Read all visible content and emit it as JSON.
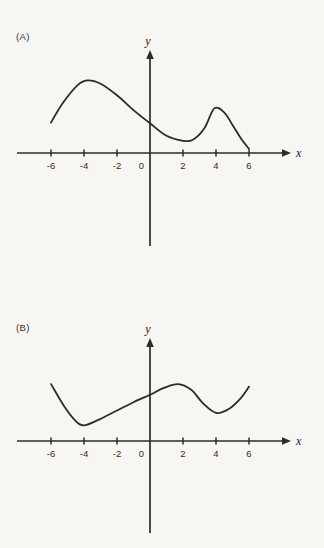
{
  "page": {
    "background": "#f7f6f3",
    "ink": "#2b2b2b"
  },
  "figures": [
    {
      "label": "(A)"
    },
    {
      "label": "(B)"
    }
  ],
  "chart_data": [
    {
      "type": "line",
      "panel": "(A)",
      "title": "",
      "xlabel": "x",
      "ylabel": "y",
      "x_ticks": [
        -6,
        -4,
        -2,
        0,
        2,
        4,
        6
      ],
      "tick_labels": [
        "-6",
        "-4",
        "-2",
        "0",
        "2",
        "4",
        "6"
      ],
      "xlim": [
        -8,
        8.5
      ],
      "ylim": [
        -5.6,
        6.2
      ],
      "grid": false,
      "legend": "none",
      "axes_style": "centered-arrow-axes",
      "x": [
        -6,
        -5.3,
        -4.4,
        -3.8,
        -3,
        -2,
        -1,
        0,
        1,
        2,
        2.6,
        3.3,
        3.9,
        4.5,
        5,
        5.5,
        6
      ],
      "y": [
        1.85,
        3.0,
        4.1,
        4.4,
        4.2,
        3.5,
        2.6,
        1.8,
        1.05,
        0.74,
        0.8,
        1.5,
        2.7,
        2.45,
        1.7,
        0.9,
        0.25
      ],
      "features": {
        "local_max": [
          [
            -3.8,
            4.4
          ],
          [
            3.9,
            2.7
          ]
        ],
        "local_min": [
          [
            2.2,
            0.74
          ]
        ],
        "endpoints": [
          [
            -6,
            1.85
          ],
          [
            6,
            0.25
          ]
        ]
      }
    },
    {
      "type": "line",
      "panel": "(B)",
      "title": "",
      "xlabel": "x",
      "ylabel": "y",
      "x_ticks": [
        -6,
        -4,
        -2,
        0,
        2,
        4,
        6
      ],
      "tick_labels": [
        "-6",
        "-4",
        "-2",
        "0",
        "2",
        "4",
        "6"
      ],
      "xlim": [
        -8,
        8.5
      ],
      "ylim": [
        -5.6,
        6.2
      ],
      "grid": false,
      "legend": "none",
      "axes_style": "centered-arrow-axes",
      "x": [
        -6,
        -5.2,
        -4.5,
        -4,
        -3.2,
        -2,
        -1,
        0,
        0.8,
        1.7,
        2.5,
        3.2,
        4,
        4.8,
        5.5,
        6
      ],
      "y": [
        3.45,
        2.1,
        1.2,
        0.95,
        1.25,
        1.85,
        2.35,
        2.8,
        3.2,
        3.45,
        3.1,
        2.3,
        1.7,
        1.95,
        2.6,
        3.3
      ],
      "features": {
        "local_max": [
          [
            1.7,
            3.45
          ]
        ],
        "local_min": [
          [
            -4,
            0.95
          ],
          [
            4,
            1.7
          ]
        ],
        "endpoints": [
          [
            -6,
            3.45
          ],
          [
            6,
            3.3
          ]
        ]
      }
    }
  ]
}
